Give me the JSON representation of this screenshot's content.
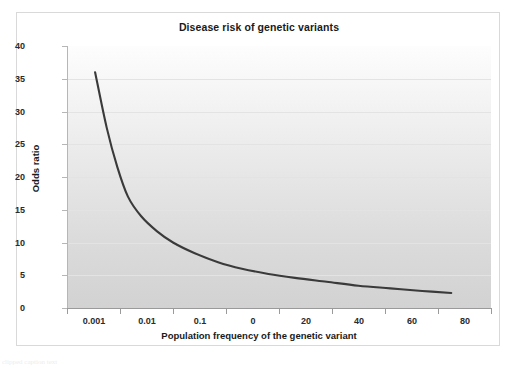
{
  "chart_data": {
    "type": "line",
    "title": "Disease risk of genetic variants",
    "xlabel": "Population frequency of the genetic variant",
    "ylabel": "Odds ratio",
    "grid": true,
    "legend": "none",
    "ylim": [
      0,
      40
    ],
    "yticks": [
      0,
      5,
      10,
      15,
      20,
      25,
      30,
      35,
      40
    ],
    "xticks": [
      "0.001",
      "0.01",
      "0.1",
      "0",
      "20",
      "40",
      "60",
      "80"
    ],
    "xtick_note": "Axis labels as printed: 0.001, 0.01, 0.1, 0, 20, 40, 60, 80 (category-style spacing)",
    "series": [
      {
        "name": "odds ratio vs population frequency",
        "points": [
          {
            "x_index": 0.53,
            "y": 36.0
          },
          {
            "x_index": 0.75,
            "y": 27.5
          },
          {
            "x_index": 0.95,
            "y": 21.5
          },
          {
            "x_index": 1.15,
            "y": 17.0
          },
          {
            "x_index": 1.4,
            "y": 14.0
          },
          {
            "x_index": 1.7,
            "y": 11.7
          },
          {
            "x_index": 2.0,
            "y": 10.0
          },
          {
            "x_index": 2.4,
            "y": 8.4
          },
          {
            "x_index": 2.85,
            "y": 7.0
          },
          {
            "x_index": 3.3,
            "y": 6.0
          },
          {
            "x_index": 3.8,
            "y": 5.2
          },
          {
            "x_index": 4.3,
            "y": 4.6
          },
          {
            "x_index": 4.9,
            "y": 4.0
          },
          {
            "x_index": 5.5,
            "y": 3.4
          },
          {
            "x_index": 6.1,
            "y": 3.0
          },
          {
            "x_index": 6.7,
            "y": 2.6
          },
          {
            "x_index": 7.25,
            "y": 2.3
          }
        ]
      }
    ],
    "colors": {
      "line": "#3a3a3a",
      "plot_background_top": "#fdfdfd",
      "plot_background_bottom": "#d2d2d2",
      "gridline": "#e3e3e3",
      "axis": "#9a9a9a",
      "text": "#1a1a1a"
    }
  },
  "bottom_caption": "clipped caption text"
}
